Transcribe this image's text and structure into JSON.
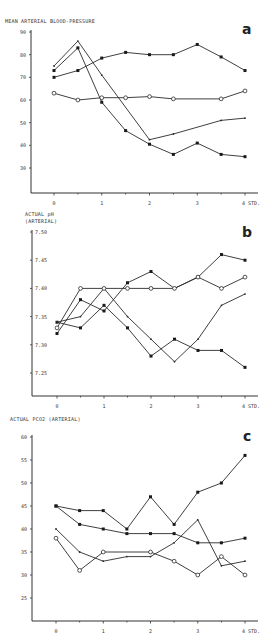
{
  "panels": [
    {
      "id": "a",
      "letter": "a",
      "title_lines": [
        "MEAN ARTERIAL BLOOD-PRESSURE"
      ],
      "top": 0,
      "height": 205
    },
    {
      "id": "b",
      "letter": "b",
      "title_lines": [
        "ACTUAL pH",
        "(ARTERIAL)"
      ],
      "top": 205,
      "height": 210
    },
    {
      "id": "c",
      "letter": "c",
      "title_lines": [
        "ACTUAL PCO2 (ARTERIAL)"
      ],
      "top": 410,
      "height": 231
    }
  ],
  "chart_data": [
    {
      "type": "line",
      "panel": "a",
      "title": "MEAN ARTERIAL BLOOD-PRESSURE",
      "xlabel": "STD.",
      "ylabel": "",
      "x": [
        0,
        0.5,
        1,
        1.5,
        2,
        2.5,
        3,
        3.5,
        4
      ],
      "x_ticks": [
        "0",
        "1",
        "2",
        "3",
        "4 STD."
      ],
      "y_ticks": [
        30,
        40,
        50,
        60,
        70,
        80,
        90
      ],
      "ylim": [
        20,
        90
      ],
      "grid": false,
      "series": [
        {
          "name": "series-1",
          "marker": "filled",
          "x": [
            0,
            0.5,
            1,
            1.5,
            2,
            2.5,
            3,
            3.5,
            4
          ],
          "values": [
            70,
            73,
            78.5,
            81,
            80,
            80,
            84.5,
            79,
            73
          ]
        },
        {
          "name": "series-2",
          "marker": "filled",
          "x": [
            0,
            0.5,
            1,
            1.5,
            2,
            2.5,
            3,
            3.5,
            4
          ],
          "values": [
            73,
            83,
            59,
            46.5,
            40.5,
            36,
            41,
            36,
            35
          ]
        },
        {
          "name": "series-3",
          "marker": "small",
          "x": [
            0,
            0.5,
            1,
            2,
            2.5,
            3.5,
            4
          ],
          "values": [
            75,
            86,
            71,
            42.5,
            45,
            51,
            52
          ]
        },
        {
          "name": "series-4",
          "marker": "open",
          "x": [
            0,
            0.5,
            1,
            1.5,
            2,
            2.5,
            3.5,
            4
          ],
          "values": [
            63,
            60,
            61,
            61,
            61.5,
            60.5,
            60.5,
            64
          ]
        }
      ]
    },
    {
      "type": "line",
      "panel": "b",
      "title": "ACTUAL pH (ARTERIAL)",
      "xlabel": "STD.",
      "ylabel": "",
      "x_ticks": [
        "0",
        "1",
        "2",
        "3",
        "4 STD."
      ],
      "y_ticks": [
        7.25,
        7.3,
        7.35,
        7.4,
        7.45,
        7.5
      ],
      "ylim": [
        7.2,
        7.5
      ],
      "grid": false,
      "series": [
        {
          "name": "series-1",
          "marker": "filled",
          "x": [
            0,
            0.5,
            1,
            1.5,
            2,
            2.5,
            3,
            3.5,
            4
          ],
          "values": [
            7.32,
            7.38,
            7.36,
            7.41,
            7.43,
            7.4,
            7.42,
            7.46,
            7.45
          ]
        },
        {
          "name": "series-2",
          "marker": "filled",
          "x": [
            0,
            0.5,
            1,
            1.5,
            2,
            2.5,
            3,
            3.5,
            4
          ],
          "values": [
            7.34,
            7.33,
            7.37,
            7.33,
            7.28,
            7.31,
            7.29,
            7.29,
            7.26
          ]
        },
        {
          "name": "series-3",
          "marker": "small",
          "x": [
            0,
            0.5,
            1,
            1.5,
            2,
            2.5,
            3,
            3.5,
            4
          ],
          "values": [
            7.34,
            7.35,
            7.4,
            7.35,
            7.31,
            7.27,
            7.31,
            7.37,
            7.39
          ]
        },
        {
          "name": "series-4",
          "marker": "open",
          "x": [
            0,
            0.5,
            1,
            1.5,
            2,
            2.5,
            3,
            3.5,
            4
          ],
          "values": [
            7.33,
            7.4,
            7.4,
            7.4,
            7.4,
            7.4,
            7.42,
            7.4,
            7.42
          ]
        }
      ]
    },
    {
      "type": "line",
      "panel": "c",
      "title": "ACTUAL PCO2 (ARTERIAL)",
      "xlabel": "STD.",
      "ylabel": "",
      "x_ticks": [
        "0",
        "1",
        "2",
        "3",
        "4 STD."
      ],
      "y_ticks": [
        25,
        30,
        35,
        40,
        45,
        50,
        55,
        60
      ],
      "ylim": [
        20,
        60
      ],
      "grid": false,
      "series": [
        {
          "name": "series-1",
          "marker": "filled",
          "x": [
            0,
            0.5,
            1,
            1.5,
            2,
            2.5,
            3,
            3.5,
            4
          ],
          "values": [
            45,
            44,
            44,
            40,
            47,
            41,
            48,
            50,
            56
          ]
        },
        {
          "name": "series-2",
          "marker": "filled",
          "x": [
            0,
            0.5,
            1,
            1.5,
            2,
            2.5,
            3,
            3.5,
            4
          ],
          "values": [
            45,
            41,
            40,
            39,
            39,
            39,
            37,
            37,
            38
          ]
        },
        {
          "name": "series-3",
          "marker": "small",
          "x": [
            0,
            0.5,
            1,
            1.5,
            2,
            2.5,
            3,
            3.5,
            4
          ],
          "values": [
            40,
            35,
            33,
            34,
            34,
            37,
            42,
            32,
            33
          ]
        },
        {
          "name": "series-4",
          "marker": "open",
          "x": [
            0,
            0.5,
            1,
            2,
            2.5,
            3,
            3.5,
            4
          ],
          "values": [
            38,
            31,
            35,
            35,
            33,
            30,
            34,
            30
          ]
        }
      ]
    }
  ]
}
